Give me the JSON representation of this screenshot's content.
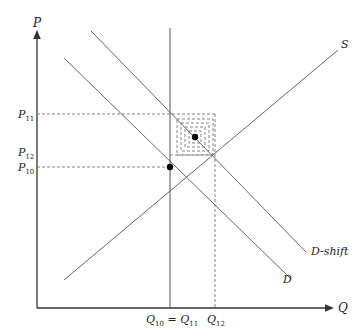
{
  "diagram": {
    "axes": {
      "y_label": "P",
      "x_label": "Q"
    },
    "curves": [
      {
        "name": "S",
        "label": "S",
        "from": [
          64,
          280
        ],
        "to": [
          338,
          50
        ]
      },
      {
        "name": "D",
        "label": "D",
        "from": [
          64,
          58
        ],
        "to": [
          290,
          278
        ]
      },
      {
        "name": "D-shift",
        "label": "D-shift",
        "from": [
          91,
          31
        ],
        "to": [
          306,
          252
        ]
      }
    ],
    "price_ticks": [
      {
        "label_main": "P",
        "label_sub": "11",
        "y": 114
      },
      {
        "label_main": "P",
        "label_sub": "12",
        "y": 153
      },
      {
        "label_main": "P",
        "label_sub": "10",
        "y": 167
      }
    ],
    "quantity_ticks": [
      {
        "label_main": "Q",
        "label_sub": "10",
        "label_eq": " = ",
        "label_main2": "Q",
        "label_sub2": "11",
        "x": 170
      },
      {
        "label_main": "Q",
        "label_sub": "12",
        "x": 215
      }
    ],
    "equilibria": [
      {
        "name": "original",
        "x": 170,
        "y": 167
      },
      {
        "name": "shifted",
        "x": 195,
        "y": 137
      }
    ],
    "colors": {
      "line": "#555555",
      "axis": "#333333",
      "dashed": "#666666",
      "point": "#000000"
    }
  }
}
